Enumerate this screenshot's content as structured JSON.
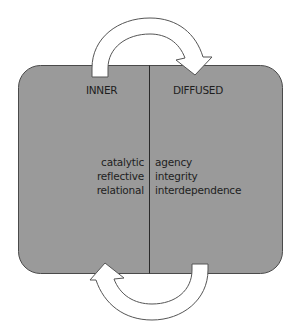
{
  "diagram": {
    "colors": {
      "box_fill": "#9a9a9a",
      "box_stroke": "#4a4a4a",
      "divider": "#2a2a2a",
      "arrow_fill": "#ffffff",
      "arrow_stroke": "#555555",
      "text": "#1e1e1e"
    },
    "left_panel": {
      "header": "INNER",
      "items": [
        "catalytic",
        "reflective",
        "relational"
      ]
    },
    "right_panel": {
      "header": "DIFFUSED",
      "items": [
        "agency",
        "integrity",
        "interdependence"
      ]
    },
    "arrows": [
      {
        "name": "top-cycle-arrow",
        "from": "INNER",
        "to": "DIFFUSED",
        "direction": "clockwise over top"
      },
      {
        "name": "bottom-cycle-arrow",
        "from": "DIFFUSED",
        "to": "INNER",
        "direction": "clockwise under bottom"
      }
    ]
  }
}
